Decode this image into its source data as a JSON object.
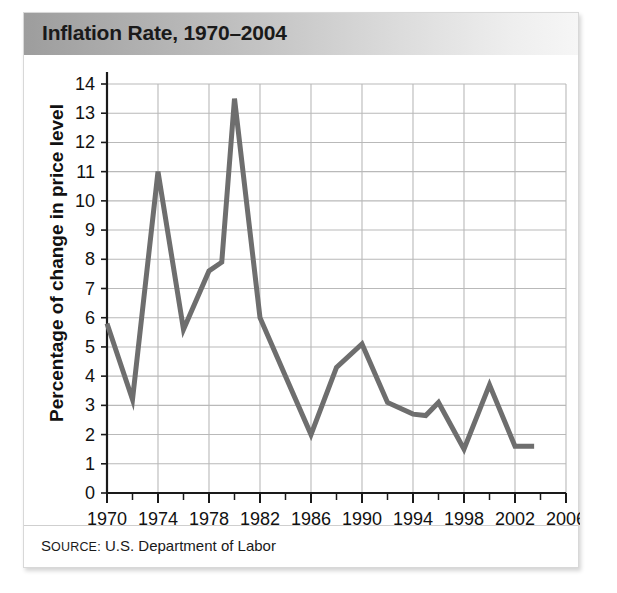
{
  "figure": {
    "title": "Inflation Rate, 1970–2004",
    "source_prefix": "S",
    "source_label": "OURCE:",
    "source_value": " U.S. Department of Labor",
    "source_full": "SOURCE: U.S. Department of Labor"
  },
  "colors": {
    "line": "#6e6e6e",
    "grid": "#b9b9b9",
    "axis": "#1a1a1a",
    "title_text": "#1a1a1a",
    "panel_background": "#ffffff",
    "header_gradient_from": "#9d9d9d",
    "header_gradient_to": "#f6f6f6"
  },
  "chart_data": {
    "type": "line",
    "title": "Inflation Rate, 1970–2004",
    "subtitle": "",
    "xlabel": "",
    "ylabel": "Percentage of change in price level",
    "xlim": [
      1970,
      2006
    ],
    "ylim": [
      0,
      14
    ],
    "xticks": [
      1970,
      1974,
      1978,
      1982,
      1986,
      1990,
      1994,
      1998,
      2002,
      2006
    ],
    "xtick_labels": [
      "1970",
      "1974",
      "1978",
      "1982",
      "1986",
      "1990",
      "1994",
      "1998",
      "2002",
      "2006"
    ],
    "xminor_step": 2,
    "yticks": [
      0,
      1,
      2,
      3,
      4,
      5,
      6,
      7,
      8,
      9,
      10,
      11,
      12,
      13,
      14
    ],
    "ytick_labels": [
      "0",
      "1",
      "2",
      "3",
      "4",
      "5",
      "6",
      "7",
      "8",
      "9",
      "10",
      "11",
      "12",
      "13",
      "14"
    ],
    "grid": true,
    "legend": false,
    "legend_position": "none",
    "series": [
      {
        "name": "Inflation rate",
        "color": "#6e6e6e",
        "x": [
          1970,
          1972,
          1974,
          1976,
          1978,
          1979,
          1980,
          1982,
          1984,
          1986,
          1988,
          1990,
          1992,
          1994,
          1995,
          1996,
          1998,
          2000,
          2002,
          2003.5
        ],
        "y": [
          5.8,
          3.2,
          11.0,
          5.6,
          7.6,
          7.9,
          13.5,
          6.0,
          4.0,
          2.0,
          4.3,
          5.1,
          3.1,
          2.7,
          2.65,
          3.1,
          1.5,
          3.7,
          1.6,
          1.6
        ]
      }
    ]
  }
}
